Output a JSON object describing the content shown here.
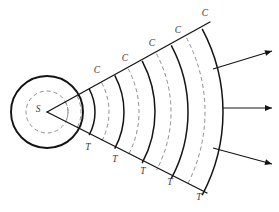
{
  "diagram": {
    "type": "wavefront-propagation",
    "background_color": "#ffffff",
    "solid_arc_color": "#141414",
    "dashed_arc_color": "#8e8e8e",
    "label_color": "#3a3a3a",
    "source": {
      "label": "S",
      "name": "source-point",
      "cx": 47,
      "cy": 112,
      "outer_circle_radius": 36,
      "inner_dashed_circle_radius": 21
    },
    "sector": {
      "apex_x": 47,
      "apex_y": 112,
      "half_angle_degrees": 28,
      "upper_ray_end": {
        "x": 210,
        "y": 22
      },
      "lower_ray_end": {
        "x": 207,
        "y": 193
      }
    },
    "wavefronts": [
      {
        "radius": 21,
        "kind": "dashed",
        "label": "",
        "name": "wavefront-inner-dashed"
      },
      {
        "radius": 34,
        "kind": "dashed",
        "label": "T",
        "name": "wavefront-trough-1"
      },
      {
        "radius": 48,
        "kind": "solid",
        "label": "C",
        "name": "wavefront-crest-1"
      },
      {
        "radius": 62,
        "kind": "dashed",
        "label": "T",
        "name": "wavefront-trough-2"
      },
      {
        "radius": 77,
        "kind": "solid",
        "label": "C",
        "name": "wavefront-crest-2"
      },
      {
        "radius": 92,
        "kind": "dashed",
        "label": "T",
        "name": "wavefront-trough-3"
      },
      {
        "radius": 108,
        "kind": "solid",
        "label": "C",
        "name": "wavefront-crest-3"
      },
      {
        "radius": 124,
        "kind": "dashed",
        "label": "T",
        "name": "wavefront-trough-4"
      },
      {
        "radius": 141,
        "kind": "solid",
        "label": "C",
        "name": "wavefront-crest-4"
      },
      {
        "radius": 158,
        "kind": "dashed",
        "label": "T",
        "name": "wavefront-trough-5"
      },
      {
        "radius": 176,
        "kind": "solid",
        "label": "C",
        "name": "wavefront-crest-5"
      }
    ],
    "crest_labels": [
      {
        "text": "C",
        "x": 97,
        "y": 71
      },
      {
        "text": "C",
        "x": 125,
        "y": 59
      },
      {
        "text": "C",
        "x": 152,
        "y": 44
      },
      {
        "text": "C",
        "x": 178,
        "y": 31
      },
      {
        "text": "C",
        "x": 205,
        "y": 14
      }
    ],
    "trough_labels": [
      {
        "text": "T",
        "x": 88,
        "y": 148
      },
      {
        "text": "T",
        "x": 115,
        "y": 160
      },
      {
        "text": "T",
        "x": 143,
        "y": 172
      },
      {
        "text": "T",
        "x": 170,
        "y": 183
      },
      {
        "text": "T",
        "x": 199,
        "y": 198
      }
    ],
    "arrows": [
      {
        "name": "propagation-arrow-upper",
        "x1": 213,
        "y1": 69,
        "x2": 272,
        "y2": 51
      },
      {
        "name": "propagation-arrow-middle",
        "x1": 223,
        "y1": 108,
        "x2": 272,
        "y2": 108
      },
      {
        "name": "propagation-arrow-lower",
        "x1": 213,
        "y1": 148,
        "x2": 272,
        "y2": 164
      }
    ]
  }
}
